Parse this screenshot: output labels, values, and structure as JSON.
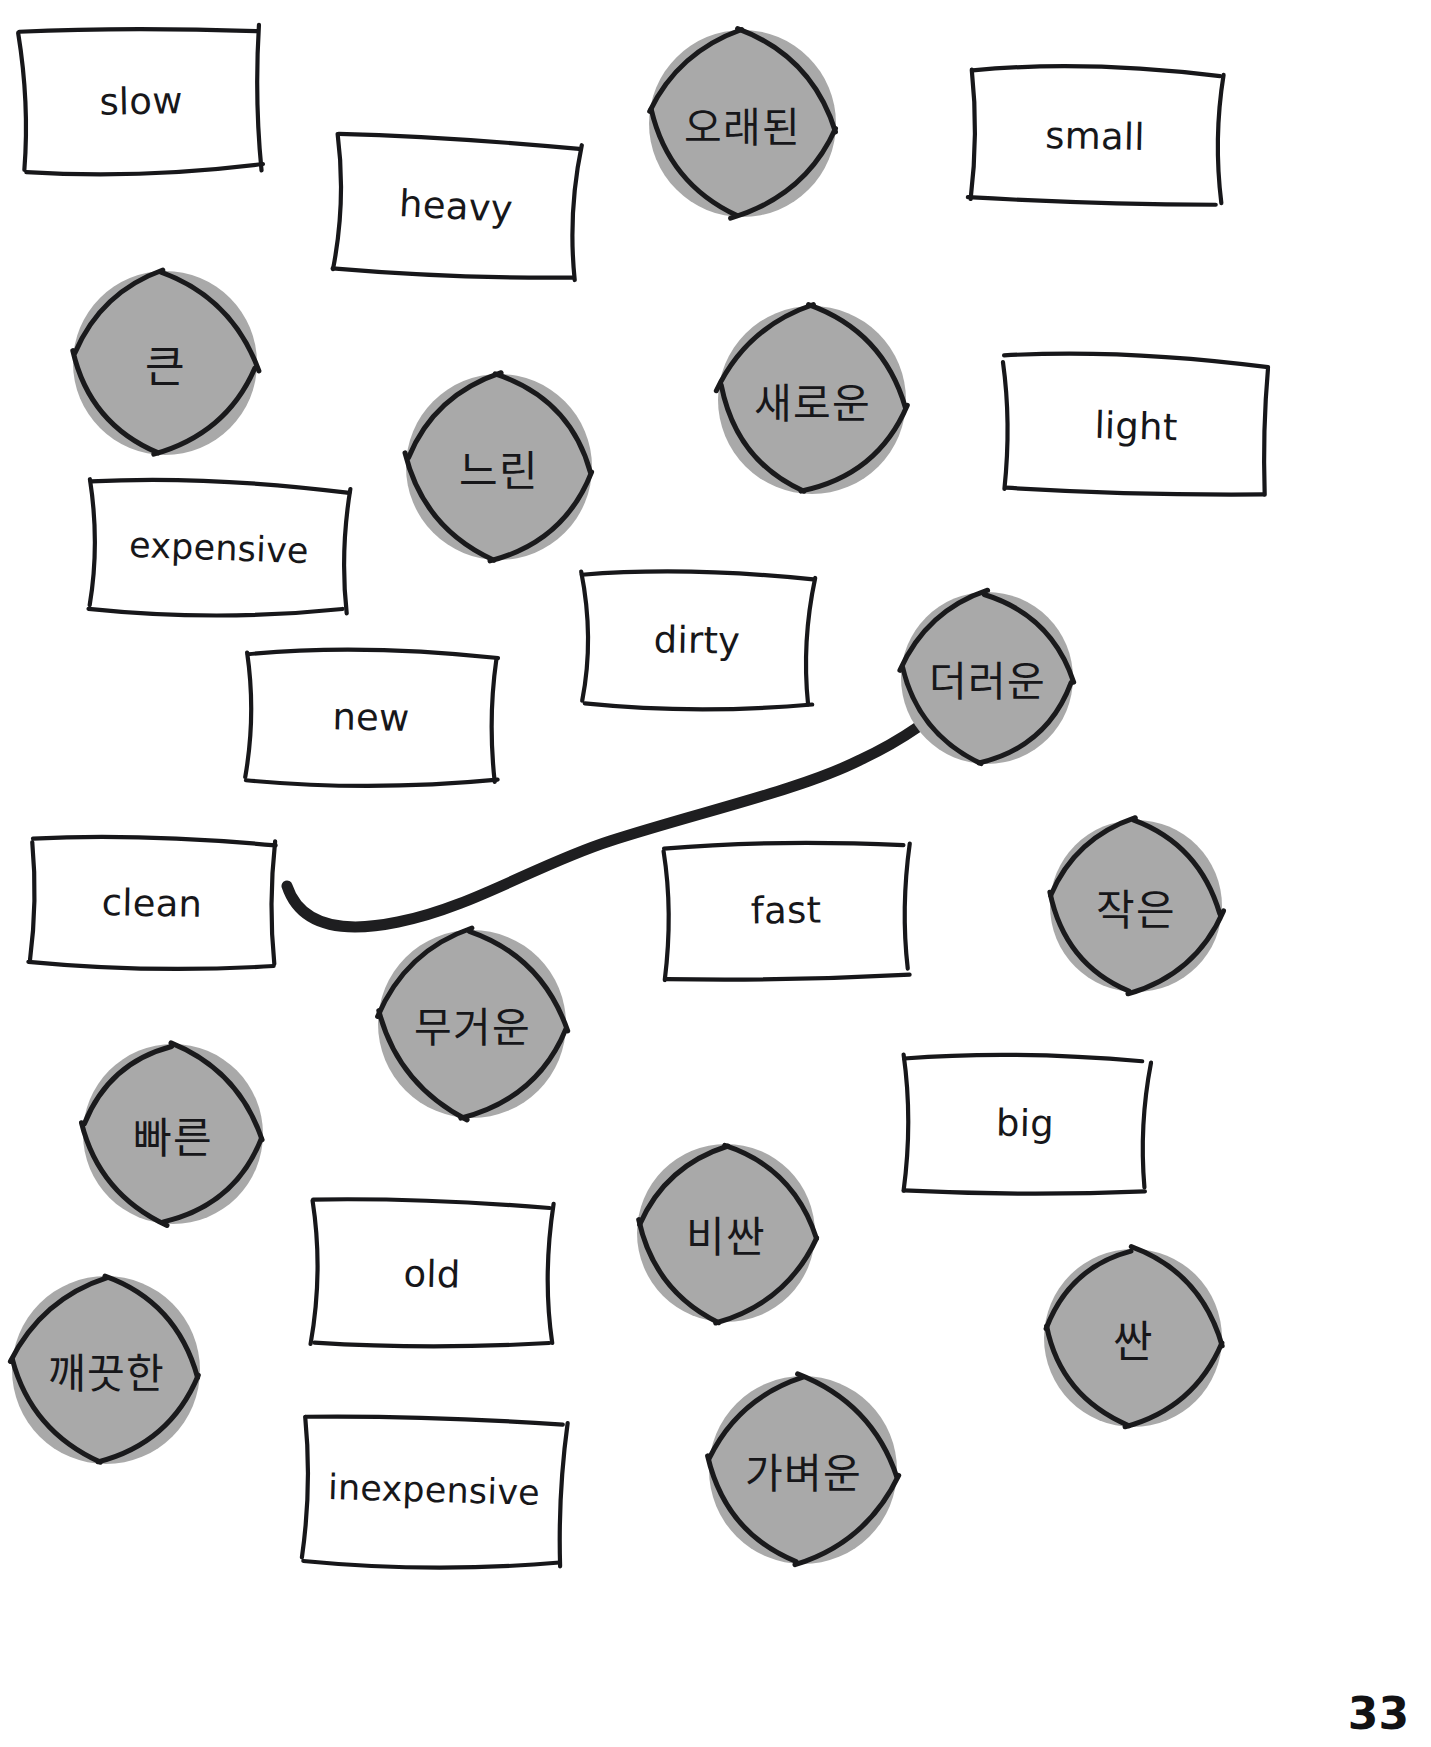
{
  "page": {
    "number": "33",
    "colors": {
      "ink": "#17171a",
      "circle_fill": "#a9a9a9",
      "circle_stroke": "#1a1a1c",
      "paper": "#ffffff",
      "connector": "#1e1e20"
    }
  },
  "english_cards": [
    {
      "label": "slow",
      "x": 16,
      "y": 26,
      "w": 250,
      "h": 150,
      "rot": -1.2,
      "wobble": 1
    },
    {
      "label": "heavy",
      "x": 330,
      "y": 135,
      "w": 252,
      "h": 143,
      "rot": 3.0,
      "wobble": 2
    },
    {
      "label": "small",
      "x": 966,
      "y": 66,
      "w": 258,
      "h": 140,
      "rot": 1.2,
      "wobble": 3
    },
    {
      "label": "light",
      "x": 1000,
      "y": 356,
      "w": 272,
      "h": 140,
      "rot": 1.6,
      "wobble": 1
    },
    {
      "label": "expensive",
      "x": 86,
      "y": 481,
      "w": 266,
      "h": 134,
      "rot": 2.0,
      "wobble": 2
    },
    {
      "label": "dirty",
      "x": 578,
      "y": 570,
      "w": 238,
      "h": 140,
      "rot": 1.0,
      "wobble": 3
    },
    {
      "label": "new",
      "x": 241,
      "y": 648,
      "w": 260,
      "h": 138,
      "rot": 1.2,
      "wobble": 1
    },
    {
      "label": "clean",
      "x": 26,
      "y": 836,
      "w": 252,
      "h": 134,
      "rot": 1.0,
      "wobble": 2
    },
    {
      "label": "fast",
      "x": 659,
      "y": 840,
      "w": 254,
      "h": 140,
      "rot": -1.0,
      "wobble": 3
    },
    {
      "label": "big",
      "x": 900,
      "y": 1052,
      "w": 250,
      "h": 142,
      "rot": 1.0,
      "wobble": 1
    },
    {
      "label": "old",
      "x": 308,
      "y": 1198,
      "w": 248,
      "h": 152,
      "rot": 1.4,
      "wobble": 2
    },
    {
      "label": "inexpensive",
      "x": 300,
      "y": 1414,
      "w": 268,
      "h": 152,
      "rot": 1.6,
      "wobble": 3
    }
  ],
  "korean_cards": [
    {
      "label": "오래된",
      "x": 645,
      "y": 26,
      "d": 195,
      "rot": 0,
      "wobble": 1,
      "size": "wide"
    },
    {
      "label": "큰",
      "x": 69,
      "y": 267,
      "d": 192,
      "rot": 0,
      "wobble": 2,
      "size": "sm"
    },
    {
      "label": "새로운",
      "x": 714,
      "y": 302,
      "d": 196,
      "rot": 0,
      "wobble": 3,
      "size": "wide"
    },
    {
      "label": "느린",
      "x": 402,
      "y": 370,
      "d": 194,
      "rot": 0,
      "wobble": 1,
      "size": ""
    },
    {
      "label": "더러운",
      "x": 897,
      "y": 588,
      "d": 180,
      "rot": 0,
      "wobble": 2,
      "size": "wide"
    },
    {
      "label": "작은",
      "x": 1046,
      "y": 816,
      "d": 180,
      "rot": 0,
      "wobble": 3,
      "size": ""
    },
    {
      "label": "무거운",
      "x": 374,
      "y": 926,
      "d": 196,
      "rot": 0,
      "wobble": 1,
      "size": "wide"
    },
    {
      "label": "빠른",
      "x": 79,
      "y": 1040,
      "d": 188,
      "rot": 0,
      "wobble": 2,
      "size": ""
    },
    {
      "label": "비싼",
      "x": 633,
      "y": 1140,
      "d": 186,
      "rot": 0,
      "wobble": 3,
      "size": ""
    },
    {
      "label": "싼",
      "x": 1040,
      "y": 1245,
      "d": 186,
      "rot": 0,
      "wobble": 1,
      "size": "sm"
    },
    {
      "label": "깨끗한",
      "x": 8,
      "y": 1272,
      "d": 196,
      "rot": 0,
      "wobble": 2,
      "size": "wide"
    },
    {
      "label": "가벼운",
      "x": 705,
      "y": 1372,
      "d": 196,
      "rot": 0,
      "wobble": 3,
      "size": "wide"
    }
  ],
  "connections": [
    {
      "from": "clean",
      "to": "더러운",
      "path": "M 287 886 C 300 925 340 934 398 922 C 470 908 538 864 610 841 C 700 812 800 790 860 760 C 890 746 905 736 918 727"
    }
  ]
}
